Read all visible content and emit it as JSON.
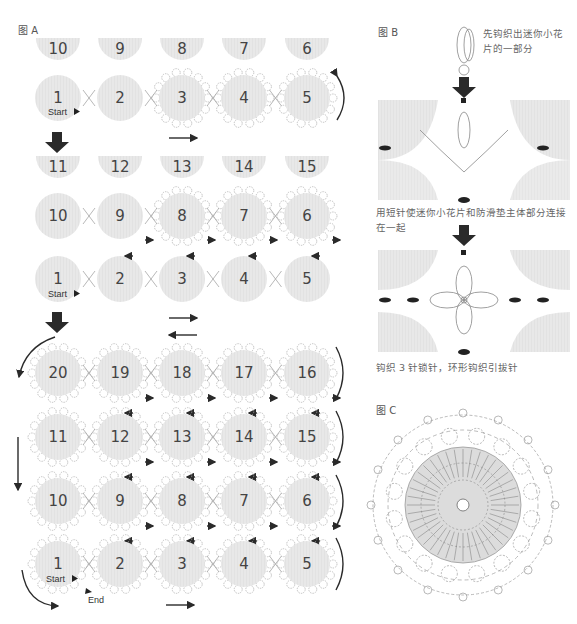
{
  "figure_a": {
    "label": "图 A",
    "stage1": {
      "top_half_numbers": [
        "10",
        "9",
        "8",
        "7",
        "6"
      ],
      "row": [
        "1",
        "2",
        "3",
        "4",
        "5"
      ],
      "start_label": "Start"
    },
    "stage2": {
      "top_half_numbers": [
        "11",
        "12",
        "13",
        "14",
        "15"
      ],
      "row_top": [
        "10",
        "9",
        "8",
        "7",
        "6"
      ],
      "row_bottom": [
        "1",
        "2",
        "3",
        "4",
        "5"
      ],
      "start_label": "Start"
    },
    "stage3": {
      "rows": [
        [
          "20",
          "19",
          "18",
          "17",
          "16"
        ],
        [
          "11",
          "12",
          "13",
          "14",
          "15"
        ],
        [
          "10",
          "9",
          "8",
          "7",
          "6"
        ],
        [
          "1",
          "2",
          "3",
          "4",
          "5"
        ]
      ],
      "start_label": "Start",
      "end_label": "End"
    }
  },
  "figure_b": {
    "label": "图 B",
    "note_1": "先钩织出迷你小花片的一部分",
    "note_2": "用短针使迷你小花片和防滑垫主体部分连接在一起",
    "note_3": "钩织 3 针锁针，环形钩织引拔针",
    "ring_label": "环"
  },
  "figure_c": {
    "label": "图 C",
    "ring_label": "环",
    "round_marks": [
      "①",
      "②",
      "③",
      "④",
      "⑤"
    ]
  },
  "colors": {
    "motif_fill": "#e6e6e6",
    "arrow": "#2a2a2a",
    "line": "#999999"
  }
}
